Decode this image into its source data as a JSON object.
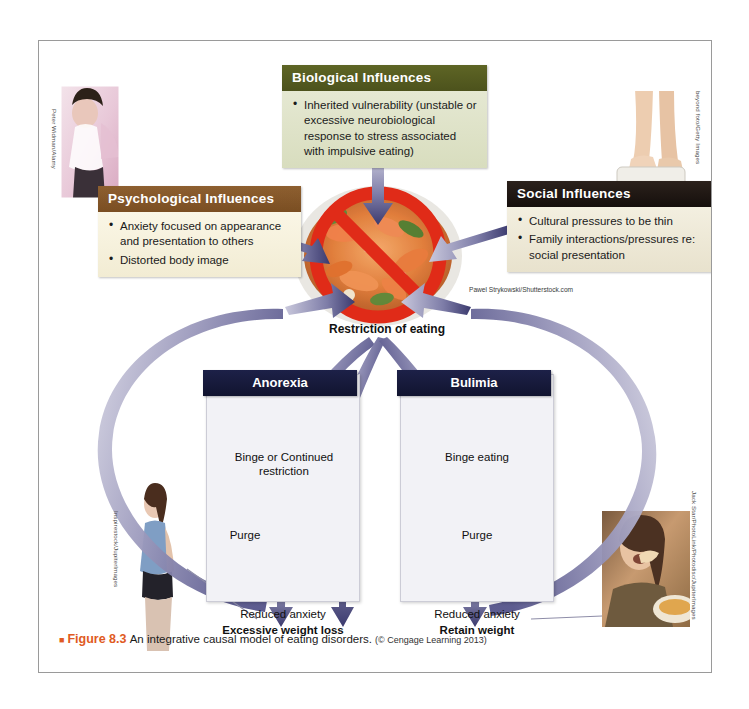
{
  "figure": {
    "marker": "■",
    "number": "Figure 8.3",
    "caption": "An integrative causal model of eating disorders.",
    "copyright": "(© Cengage Learning 2013)"
  },
  "boxes": {
    "biological": {
      "title": "Biological Influences",
      "bullets": [
        "Inherited vulnerability (unstable or excessive neurobiological response to stress associated with impulsive eating)"
      ],
      "header_color": "#565c20",
      "body_color": "#dfe3c9"
    },
    "psychological": {
      "title": "Psychological Influences",
      "bullets": [
        "Anxiety focused on appearance and presentation to others",
        "Distorted body image"
      ],
      "header_color": "#8a5a2b",
      "body_color": "#f6f0dc"
    },
    "social": {
      "title": "Social Influences",
      "bullets": [
        "Cultural pressures to be thin",
        "Family interactions/pressures re: social presentation"
      ],
      "header_color": "#1e1712",
      "body_color": "#eee9d8"
    }
  },
  "center": {
    "restriction_label": "Restriction of eating",
    "food_image_alt": "plate of shrimp salad with red prohibition sign"
  },
  "panels": [
    {
      "title": "Anorexia",
      "steps": [
        "Binge or Continued restriction",
        "Purge",
        "Reduced anxiety"
      ],
      "outcome": "Excessive weight loss",
      "header_color": "#161a3c"
    },
    {
      "title": "Bulimia",
      "steps": [
        "Binge eating",
        "Purge",
        "Reduced anxiety"
      ],
      "outcome": "Retain weight",
      "header_color": "#161a3c"
    }
  ],
  "credits": {
    "left_top": "Peter Widman/Alamy",
    "right_top": "beyond foto/Getty Images",
    "left_bottom": "Inspirestock/JupiterImages",
    "right_bottom": "Jack Star/PhotoLink/Photodisc/JupiterImages",
    "food": "Pawel Strykowski/Shutterstock.com"
  },
  "colors": {
    "arrow_purple_dark": "#3b3a6e",
    "arrow_purple_light": "#b3b2cc",
    "prohibition_red": "#e02b18",
    "accent_orange": "#e05a22",
    "panel_bg": "#f2f2f6",
    "frame_border": "#9a9a9a"
  }
}
